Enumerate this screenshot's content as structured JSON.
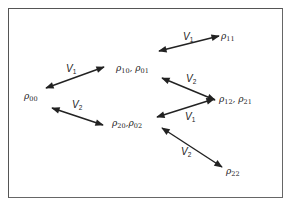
{
  "diagram": {
    "type": "state-transition",
    "frame": {
      "stroke": "#555555",
      "background": "#ffffff"
    },
    "nodes": [
      {
        "id": "rho00",
        "symbol": "ρ",
        "sub": "00",
        "x": 24,
        "y": 92
      },
      {
        "id": "rho10_01",
        "symbol": "ρ",
        "sub": "10",
        "sep": ", ",
        "symbol2": "ρ",
        "sub2": "01",
        "x": 116,
        "y": 64
      },
      {
        "id": "rho11",
        "symbol": "ρ",
        "sub": "11",
        "x": 221,
        "y": 32
      },
      {
        "id": "rho12_21",
        "symbol": "ρ",
        "sub": "12",
        "sep": ", ",
        "symbol2": "ρ",
        "sub2": "21",
        "x": 219,
        "y": 95
      },
      {
        "id": "rho20_02",
        "symbol": "ρ",
        "sub": "20",
        "sep": ",",
        "symbol2": "ρ",
        "sub2": "02",
        "x": 112,
        "y": 119
      },
      {
        "id": "rho22",
        "symbol": "ρ",
        "sub": "22",
        "x": 226,
        "y": 167
      }
    ],
    "edges": [
      {
        "from": "rho00",
        "to": "rho10_01",
        "label": "V",
        "label_sub": "1",
        "x1": 46,
        "y1": 88,
        "x2": 104,
        "y2": 67,
        "lx": 66,
        "ly": 64
      },
      {
        "from": "rho00",
        "to": "rho20_02",
        "label": "V",
        "label_sub": "2",
        "x1": 52,
        "y1": 108,
        "x2": 103,
        "y2": 125,
        "lx": 72,
        "ly": 100
      },
      {
        "from": "rho10_01",
        "to": "rho11",
        "label": "V",
        "label_sub": "1",
        "x1": 159,
        "y1": 51,
        "x2": 219,
        "y2": 36,
        "lx": 183,
        "ly": 32
      },
      {
        "from": "rho10_01",
        "to": "rho12_21",
        "label": "V",
        "label_sub": "2",
        "x1": 162,
        "y1": 78,
        "x2": 215,
        "y2": 100,
        "lx": 186,
        "ly": 74
      },
      {
        "from": "rho12_21",
        "to": "rho20_02",
        "label": "V",
        "label_sub": "1",
        "x1": 214,
        "y1": 99,
        "x2": 157,
        "y2": 117,
        "lx": 185,
        "ly": 112
      },
      {
        "from": "rho20_02",
        "to": "rho22",
        "label": "V",
        "label_sub": "2",
        "x1": 162,
        "y1": 128,
        "x2": 222,
        "y2": 167,
        "lx": 181,
        "ly": 147
      }
    ],
    "arrow_color": "#222222"
  }
}
